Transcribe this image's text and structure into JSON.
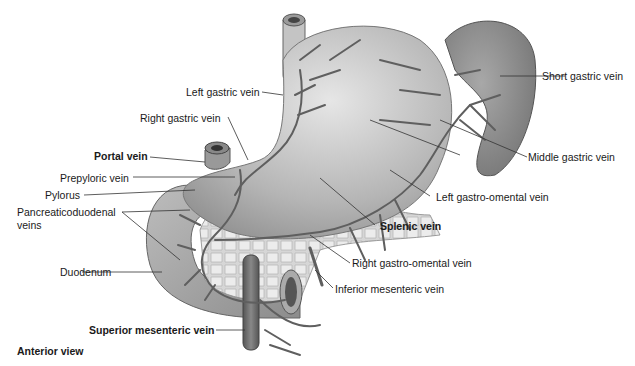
{
  "diagram": {
    "view_caption": "Anterior view",
    "colors": {
      "organ_fill": "#9a9a9a",
      "organ_light": "#cfcfcf",
      "vein": "#6a6a6a",
      "spleen": "#7d7d7d",
      "text": "#1a1a1a",
      "leader": "#333333"
    },
    "organs": [
      "stomach",
      "spleen",
      "pancreas",
      "duodenum",
      "esophagus"
    ],
    "labels": {
      "left_gastric_vein": "Left gastric vein",
      "short_gastric_vein": "Short gastric vein",
      "right_gastric_vein": "Right gastric vein",
      "portal_vein": "Portal vein",
      "middle_gastric_vein": "Middle gastric vein",
      "prepyloric_vein": "Prepyloric vein",
      "pylorus": "Pylorus",
      "left_gastro_omental_vein": "Left gastro-omental vein",
      "pancreaticoduodenal_veins_1": "Pancreaticoduodenal",
      "pancreaticoduodenal_veins_2": "veins",
      "splenic_vein": "Splenic vein",
      "duodenum": "Duodenum",
      "right_gastro_omental_vein": "Right gastro-omental vein",
      "inferior_mesenteric_vein": "Inferior mesenteric vein",
      "superior_mesenteric_vein": "Superior mesenteric vein"
    }
  }
}
